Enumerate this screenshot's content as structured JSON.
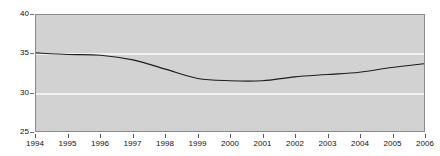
{
  "chart_data": {
    "type": "line",
    "title": "",
    "subtitle": "",
    "xlabel": "",
    "ylabel": "",
    "categories": [
      "1994",
      "1995",
      "1996",
      "1997",
      "1998",
      "1999",
      "2000",
      "2001",
      "2002",
      "2003",
      "2004",
      "2005",
      "2006"
    ],
    "x": [
      1994,
      1995,
      1996,
      1997,
      1998,
      1999,
      2000,
      2001,
      2002,
      2003,
      2004,
      2005,
      2006
    ],
    "values": [
      35.1,
      34.9,
      34.8,
      34.2,
      33.0,
      31.8,
      31.5,
      31.5,
      32.0,
      32.3,
      32.6,
      33.2,
      33.7
    ],
    "series": [
      {
        "name": "",
        "values": [
          35.1,
          34.9,
          34.8,
          34.2,
          33.0,
          31.8,
          31.5,
          31.5,
          32.0,
          32.3,
          32.6,
          33.2,
          33.7
        ]
      }
    ],
    "ylim": [
      25,
      40
    ],
    "xlim": [
      1994,
      2006
    ],
    "yticks": [
      25,
      30,
      35,
      40
    ],
    "ytick_labels": [
      "25",
      "30",
      "35",
      "40"
    ],
    "xtick_labels": [
      "1994",
      "1995",
      "1996",
      "1997",
      "1998",
      "1999",
      "2000",
      "2001",
      "2002",
      "2003",
      "2004",
      "2005",
      "2006"
    ],
    "gridlines": {
      "horizontal": true,
      "vertical": false,
      "values": [
        30,
        35
      ]
    },
    "legend": {
      "visible": false,
      "position": "none"
    },
    "annotations": [],
    "colors": {
      "plot_background": "#d2d2d2",
      "figure_background": "#ffffff",
      "series_line": "#1d1d1d",
      "gridline": "#f2f2f2",
      "frame": "#8a8a8a",
      "tick_label": "#111111"
    }
  }
}
